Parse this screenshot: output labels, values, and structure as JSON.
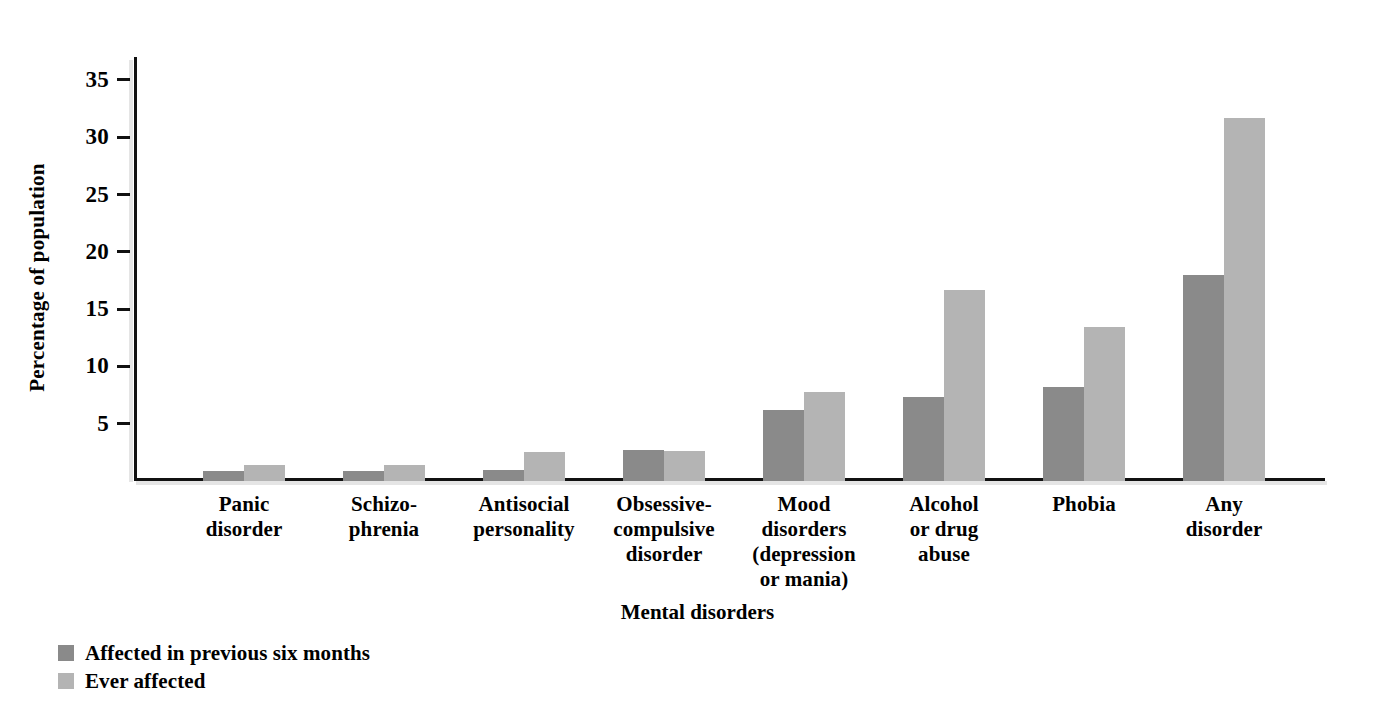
{
  "chart_data": {
    "type": "bar",
    "title": "",
    "xlabel": "Mental disorders",
    "ylabel": "Percentage of population",
    "ylim": [
      0,
      37
    ],
    "grid": false,
    "legend_position": "bottom-left",
    "yticks": [
      5,
      10,
      15,
      20,
      25,
      30,
      35
    ],
    "ytick_labels": [
      "5",
      "10",
      "15",
      "20",
      "25",
      "30",
      "35"
    ],
    "categories": [
      "Panic disorder",
      "Schizophrenia",
      "Antisocial personality",
      "Obsessive-compulsive disorder",
      "Mood disorders (depression or mania)",
      "Alcohol or drug abuse",
      "Phobia",
      "Any disorder"
    ],
    "category_lines": [
      [
        "Panic",
        "disorder"
      ],
      [
        "Schizo-",
        "phrenia"
      ],
      [
        "Antisocial",
        "personality"
      ],
      [
        "Obsessive-",
        "compulsive",
        "disorder"
      ],
      [
        "Mood",
        "disorders",
        "(depression",
        "or mania)"
      ],
      [
        "Alcohol",
        "or drug",
        "abuse"
      ],
      [
        "Phobia"
      ],
      [
        "Any",
        "disorder"
      ]
    ],
    "series": [
      {
        "name": "Affected in previous six months",
        "color": "#8a8a8a",
        "values": [
          0.9,
          0.9,
          1.0,
          2.7,
          6.2,
          7.3,
          8.2,
          18.0
        ]
      },
      {
        "name": "Ever affected",
        "color": "#b4b4b4",
        "values": [
          1.4,
          1.4,
          2.5,
          2.6,
          7.8,
          16.7,
          13.4,
          31.7
        ]
      }
    ]
  },
  "axes": {
    "y_title": "Percentage of population",
    "x_title": "Mental disorders"
  },
  "legend": {
    "items": [
      {
        "label": "Affected in previous six months",
        "color": "#8a8a8a"
      },
      {
        "label": "Ever affected",
        "color": "#b4b4b4"
      }
    ]
  },
  "colors": {
    "series_dark": "#8a8a8a",
    "series_light": "#b4b4b4",
    "axis": "#111111",
    "background": "#ffffff"
  }
}
